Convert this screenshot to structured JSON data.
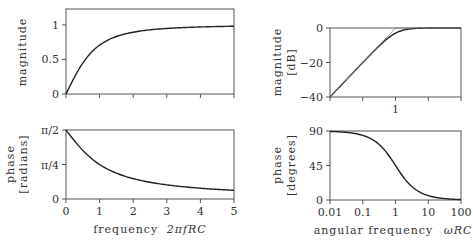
{
  "chart_data": [
    {
      "id": "linear-magnitude",
      "type": "line",
      "title": "",
      "xlabel": "",
      "ylabel": "magnitude",
      "xlim": [
        0,
        5
      ],
      "ylim": [
        0,
        1.23
      ],
      "xscale": "linear",
      "xticks": [
        0,
        1,
        2,
        3,
        4,
        5
      ],
      "xtick_labels": [
        "",
        "",
        "",
        "",
        "",
        ""
      ],
      "yticks": [
        0,
        0.5,
        1
      ],
      "ytick_labels": [
        "0",
        "0.5",
        "1"
      ],
      "grid": false,
      "series": [
        {
          "name": "magnitude",
          "x": [
            0,
            0.25,
            0.5,
            0.75,
            1,
            1.5,
            2,
            2.5,
            3,
            4,
            5
          ],
          "y": [
            0,
            0.243,
            0.447,
            0.6,
            0.707,
            0.832,
            0.894,
            0.928,
            0.949,
            0.97,
            0.981
          ]
        }
      ]
    },
    {
      "id": "linear-phase",
      "type": "line",
      "title": "",
      "xlabel": "frequency 2πfRC",
      "ylabel": "phase [radians]",
      "xlim": [
        0,
        5
      ],
      "ylim": [
        0,
        1.5708
      ],
      "xscale": "linear",
      "xticks": [
        0,
        1,
        2,
        3,
        4,
        5
      ],
      "xtick_labels": [
        "0",
        "1",
        "2",
        "3",
        "4",
        "5"
      ],
      "yticks": [
        0,
        0.7854,
        1.5708
      ],
      "ytick_labels": [
        "0",
        "π/4",
        "π/2"
      ],
      "grid": false,
      "series": [
        {
          "name": "phase",
          "x": [
            0,
            0.25,
            0.5,
            0.75,
            1,
            1.5,
            2,
            2.5,
            3,
            4,
            5
          ],
          "y": [
            1.571,
            1.326,
            1.107,
            0.927,
            0.785,
            0.588,
            0.464,
            0.381,
            0.322,
            0.245,
            0.197
          ]
        }
      ]
    },
    {
      "id": "bode-magnitude",
      "type": "line",
      "title": "",
      "xlabel": "",
      "ylabel": "magnitude [dB]",
      "xlim": [
        0.01,
        100
      ],
      "ylim": [
        -40,
        0
      ],
      "xscale": "log",
      "xticks": [
        0.01,
        0.1,
        1,
        10,
        100
      ],
      "xtick_labels": [
        "",
        "",
        "1",
        "",
        ""
      ],
      "yticks": [
        -40,
        -20,
        0
      ],
      "ytick_labels": [
        "−40",
        "−20",
        "0"
      ],
      "grid": false,
      "series": [
        {
          "name": "magnitude",
          "x": [
            0.01,
            0.03,
            0.1,
            0.3,
            0.5,
            1,
            2,
            3,
            10,
            30,
            100
          ],
          "y": [
            -40,
            -30.5,
            -20.04,
            -10.8,
            -6.99,
            -3.01,
            -0.97,
            -0.46,
            -0.04,
            0,
            0
          ]
        },
        {
          "name": "asymptote",
          "style": "thin",
          "x": [
            0.01,
            1,
            100
          ],
          "y": [
            -40,
            0,
            0
          ]
        }
      ]
    },
    {
      "id": "bode-phase",
      "type": "line",
      "title": "",
      "xlabel": "angular frequency ωRC",
      "ylabel": "phase [degrees]",
      "xlim": [
        0.01,
        100
      ],
      "ylim": [
        0,
        90
      ],
      "xscale": "log",
      "xticks": [
        0.01,
        0.1,
        1,
        10,
        100
      ],
      "xtick_labels": [
        "0.01",
        "0.1",
        "1",
        "10",
        "100"
      ],
      "yticks": [
        0,
        45,
        90
      ],
      "ytick_labels": [
        "0",
        "45",
        "90"
      ],
      "grid": false,
      "series": [
        {
          "name": "phase",
          "x": [
            0.01,
            0.03,
            0.1,
            0.3,
            0.5,
            1,
            2,
            3,
            10,
            30,
            100
          ],
          "y": [
            89.4,
            88.3,
            84.3,
            73.3,
            63.4,
            45,
            26.6,
            18.4,
            5.7,
            1.9,
            0.6
          ]
        }
      ]
    }
  ],
  "labels": {
    "tl_ylabel": "magnitude",
    "bl_ylabel_1": "phase",
    "bl_ylabel_2": "[radians]",
    "bl_xlabel_prefix": "frequency",
    "bl_xlabel_math": "2πfRC",
    "tr_ylabel_1": "magnitude",
    "tr_ylabel_2": "[dB]",
    "br_ylabel_1": "phase",
    "br_ylabel_2": "[degrees]",
    "br_xlabel_prefix": "angular frequency",
    "br_xlabel_math": "ωRC"
  },
  "colors": {
    "curve": "#222222",
    "axis": "#555555",
    "asymptote": "#888888"
  }
}
